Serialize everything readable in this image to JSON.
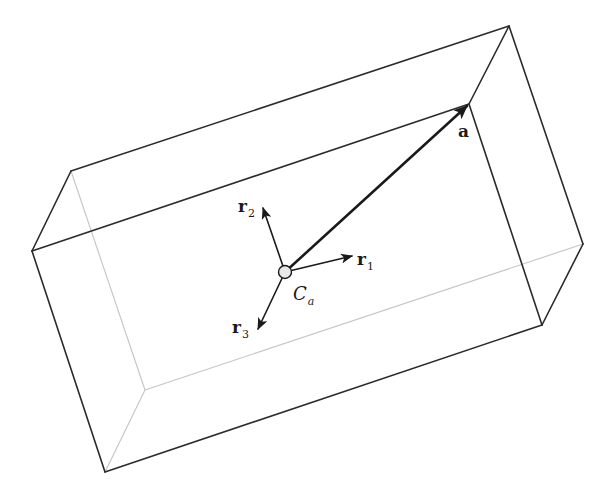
{
  "diagram": {
    "center_point": {
      "label_main": "C",
      "label_sub": "a"
    },
    "vectors": [
      {
        "id": "a",
        "label_main": "a",
        "label_sub": ""
      },
      {
        "id": "r1",
        "label_main": "r",
        "label_sub": "1"
      },
      {
        "id": "r2",
        "label_main": "r",
        "label_sub": "2"
      },
      {
        "id": "r3",
        "label_main": "r",
        "label_sub": "3"
      }
    ],
    "colors": {
      "front_edge": "#2b2b2b",
      "hidden_edge": "#c4c4c4",
      "vector": "#1a1a1a",
      "center_fill": "#e8e8e8"
    }
  }
}
